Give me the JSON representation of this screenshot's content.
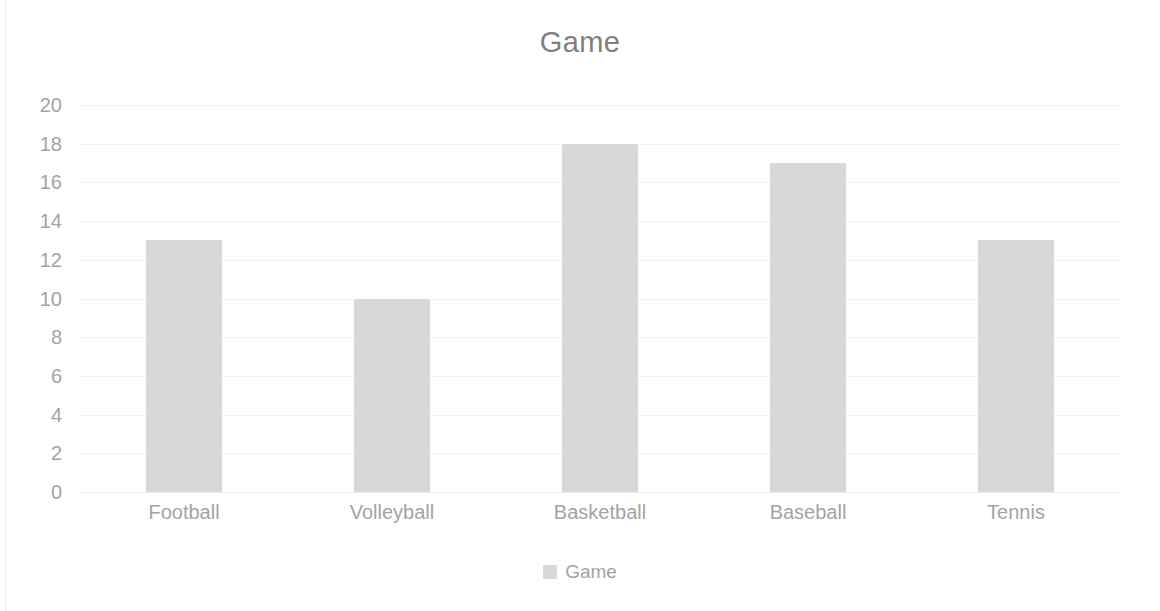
{
  "chart_data": {
    "type": "bar",
    "title": "Game",
    "xlabel": "",
    "ylabel": "",
    "categories": [
      "Football",
      "Volleyball",
      "Basketball",
      "Baseball",
      "Tennis"
    ],
    "values": [
      13,
      10,
      18,
      17,
      13
    ],
    "series": [
      {
        "name": "Game",
        "values": [
          13,
          10,
          18,
          17,
          13
        ]
      }
    ],
    "ylim": [
      0,
      20
    ],
    "ytick_step": 2,
    "yticks": [
      20,
      18,
      16,
      14,
      12,
      10,
      8,
      6,
      4,
      2,
      0
    ],
    "grid": "horizontal",
    "legend_position": "bottom",
    "legend_entries": [
      "Game"
    ],
    "colors": {
      "bar": "#d8d8d8",
      "title_text": "#7f7f7f",
      "axis_text": "#a3a3a3",
      "gridline": "#f3f3f3",
      "background": "#ffffff"
    }
  }
}
